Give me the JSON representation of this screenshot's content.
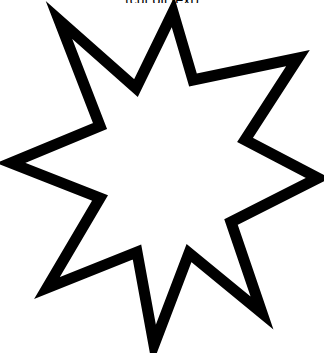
{
  "caption": {
    "text": "(cut off text)"
  },
  "shape": {
    "type": "eight-pointed-star",
    "name": "star-outline",
    "stroke_color": "#000000",
    "fill_color": "#ffffff",
    "stroke_width": 11,
    "points": "173,12 193,80 298,58 245,140 318,178 231,222 262,313 189,253 154,345 137,252 47,288 100,198 11,163 100,126 59,20 136,88"
  }
}
